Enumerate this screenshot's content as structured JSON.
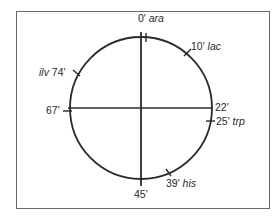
{
  "diagram": {
    "type": "circular-genetic-map",
    "colors": {
      "line": "#2a2a2a",
      "frame": "#6a6a6a",
      "background": "#ffffff"
    },
    "axes": {
      "vertical": {
        "top_label": "0'",
        "bottom_label": "45'"
      },
      "horizontal": {
        "left_label": "67'",
        "right_label": "22'"
      }
    },
    "markers": [
      {
        "minute": "0'",
        "gene": "ara"
      },
      {
        "minute": "10'",
        "gene": "lac"
      },
      {
        "minute": "22'",
        "gene": ""
      },
      {
        "minute": "25'",
        "gene": "trp"
      },
      {
        "minute": "39'",
        "gene": "his"
      },
      {
        "minute": "45'",
        "gene": ""
      },
      {
        "minute": "67'",
        "gene": ""
      },
      {
        "minute": "74'",
        "gene": "ilv"
      }
    ]
  }
}
